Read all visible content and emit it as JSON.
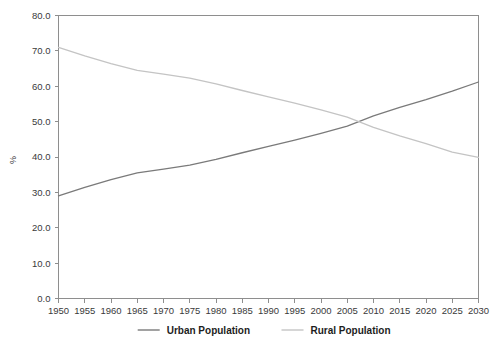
{
  "chart_data": {
    "type": "line",
    "title": "",
    "subtitle": "",
    "xlabel": "",
    "ylabel": "%",
    "grid": false,
    "legend_position": "bottom",
    "xlim": [
      1950,
      2030
    ],
    "ylim": [
      0.0,
      80.0
    ],
    "x": [
      1950,
      1955,
      1960,
      1965,
      1970,
      1975,
      1980,
      1985,
      1990,
      1995,
      2000,
      2005,
      2010,
      2015,
      2020,
      2025,
      2030
    ],
    "xticklabels": [
      "1950",
      "1955",
      "1960",
      "1965",
      "1970",
      "1975",
      "1980",
      "1985",
      "1990",
      "1995",
      "2000",
      "2005",
      "2010",
      "2015",
      "2020",
      "2025",
      "2030"
    ],
    "yticks": [
      0.0,
      10.0,
      20.0,
      30.0,
      40.0,
      50.0,
      60.0,
      70.0,
      80.0
    ],
    "yticklabels": [
      "0.0",
      "10.0",
      "20.0",
      "30.0",
      "40.0",
      "50.0",
      "60.0",
      "70.0",
      "80.0"
    ],
    "series": [
      {
        "name": "Urban Population",
        "color": "#7a7a7a",
        "values": [
          29.0,
          31.4,
          33.6,
          35.5,
          36.6,
          37.7,
          39.3,
          41.2,
          43.0,
          44.8,
          46.7,
          48.7,
          51.6,
          54.0,
          56.2,
          58.6,
          61.2
        ]
      },
      {
        "name": "Rural Population",
        "color": "#c4c4c4",
        "values": [
          71.0,
          68.6,
          66.4,
          64.5,
          63.4,
          62.3,
          60.7,
          58.8,
          57.0,
          55.2,
          53.3,
          51.3,
          48.4,
          46.0,
          43.8,
          41.4,
          39.9
        ]
      }
    ],
    "legend": [
      {
        "label": "Urban Population",
        "color": "#7a7a7a"
      },
      {
        "label": "Rural Population",
        "color": "#c4c4c4"
      }
    ],
    "annotations": {
      "crossover_year": 2007,
      "crossover_value": 50.0
    }
  },
  "axes": {
    "y_axis_title": "%"
  }
}
